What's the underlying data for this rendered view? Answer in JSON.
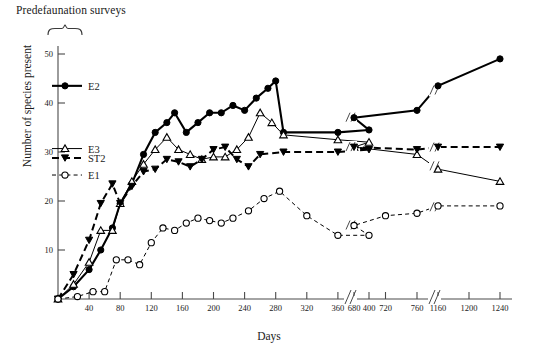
{
  "annotations": {
    "predefaunation_label": "Predefaunation surveys",
    "brace_icon": "curly-brace-up"
  },
  "chart_data": {
    "type": "line",
    "title": "",
    "xlabel": "Days",
    "ylabel": "Number of species present",
    "ylim": [
      0,
      52
    ],
    "yticks": [
      10,
      20,
      30,
      40,
      50
    ],
    "xticks": [
      40,
      80,
      120,
      160,
      200,
      240,
      280,
      320,
      360,
      400,
      680,
      720,
      760,
      1160,
      1200,
      1240
    ],
    "axis_breaks": [
      {
        "after": 400,
        "before": 680
      },
      {
        "after": 760,
        "before": 1160
      }
    ],
    "grid": false,
    "legend_position": "inside-left",
    "series": [
      {
        "name": "E2",
        "marker": "filled-circle",
        "linestyle": "solid",
        "x": [
          0,
          20,
          40,
          55,
          70,
          80,
          95,
          110,
          125,
          140,
          150,
          165,
          180,
          195,
          210,
          225,
          240,
          255,
          270,
          280,
          290,
          360,
          400,
          680,
          760,
          1160,
          1240
        ],
        "values": [
          0,
          2.5,
          6,
          10,
          14.5,
          19.5,
          23.5,
          29.5,
          34,
          36,
          38,
          34,
          36,
          38,
          38,
          39.5,
          38.5,
          41,
          43,
          44.5,
          34,
          34,
          34.5,
          37,
          38.5,
          43.5,
          49
        ]
      },
      {
        "name": "E3",
        "marker": "open-triangle",
        "linestyle": "solid",
        "x": [
          0,
          20,
          40,
          55,
          70,
          80,
          95,
          110,
          125,
          140,
          155,
          170,
          185,
          200,
          215,
          230,
          245,
          260,
          275,
          290,
          360,
          400,
          680,
          760,
          1160,
          1240
        ],
        "values": [
          0,
          3,
          7.5,
          14,
          14,
          19.5,
          24,
          27.5,
          30.5,
          33,
          30.5,
          29.5,
          28.5,
          29,
          29,
          30.5,
          33,
          38,
          36,
          33.5,
          32.5,
          32,
          31,
          29.5,
          26.5,
          24
        ]
      },
      {
        "name": "ST2",
        "marker": "filled-triangle",
        "linestyle": "dashed",
        "x": [
          0,
          20,
          40,
          55,
          70,
          80,
          95,
          110,
          125,
          140,
          155,
          170,
          185,
          200,
          215,
          230,
          245,
          260,
          290,
          360,
          400,
          680,
          760,
          1160,
          1240
        ],
        "values": [
          0,
          5,
          12,
          19.5,
          23.5,
          19.5,
          23,
          26,
          26.5,
          28.5,
          28,
          27,
          28.5,
          30.5,
          31,
          28.5,
          27,
          29.5,
          30,
          30,
          30.5,
          31,
          30.5,
          31,
          31
        ]
      },
      {
        "name": "E1",
        "marker": "open-circle",
        "linestyle": "dashed",
        "x": [
          0,
          25,
          45,
          60,
          75,
          90,
          105,
          120,
          135,
          150,
          165,
          180,
          195,
          210,
          225,
          245,
          265,
          285,
          320,
          360,
          400,
          680,
          720,
          760,
          1160,
          1240
        ],
        "values": [
          0,
          0.5,
          1.5,
          1.5,
          8,
          8,
          7,
          11.5,
          14.5,
          14,
          15.5,
          16.5,
          16,
          15.5,
          16.5,
          18,
          20.5,
          22,
          17,
          13,
          13,
          15,
          17,
          17.5,
          19,
          19
        ]
      }
    ],
    "legend": [
      {
        "label": "E2",
        "marker": "filled-circle",
        "linestyle": "solid"
      },
      {
        "label": "E3",
        "marker": "open-triangle",
        "linestyle": "solid"
      },
      {
        "label": "ST2",
        "marker": "filled-triangle",
        "linestyle": "dashed"
      },
      {
        "label": "E1",
        "marker": "open-circle",
        "linestyle": "dashed"
      }
    ]
  }
}
